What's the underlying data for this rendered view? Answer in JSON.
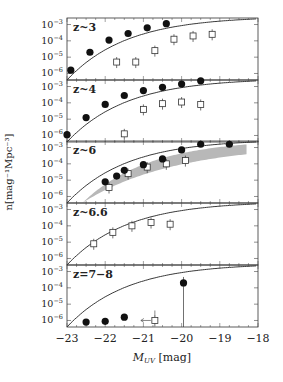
{
  "chart_data": {
    "type": "scatter",
    "xlabel": "M_UV [mag]",
    "ylabel": "n [mag^-1 Mpc^-3]",
    "xlim": [
      -23,
      -18
    ],
    "xticks": [
      -23,
      -22,
      -21,
      -20,
      -19,
      -18
    ],
    "ylim_log10": [
      -6.4,
      -2.6
    ],
    "yticks": [
      "10^-3",
      "10^-4",
      "10^-5",
      "10^-6"
    ],
    "panels": [
      {
        "label": "z~3",
        "filled": [
          [
            -22.9,
            -5.8
          ],
          [
            -22.4,
            -4.7
          ],
          [
            -21.9,
            -3.95
          ],
          [
            -21.4,
            -3.55
          ],
          [
            -20.9,
            -3.2
          ],
          [
            -20.4,
            -2.95
          ]
        ],
        "open": [
          [
            -21.7,
            -5.3
          ],
          [
            -21.2,
            -5.3
          ],
          [
            -20.7,
            -4.6
          ],
          [
            -20.2,
            -3.9
          ],
          [
            -19.7,
            -3.7
          ],
          [
            -19.2,
            -3.6
          ]
        ],
        "curve": true,
        "band": false
      },
      {
        "label": "z~4",
        "filled": [
          [
            -23.0,
            -5.95
          ],
          [
            -22.5,
            -4.9
          ],
          [
            -22.0,
            -4.1
          ],
          [
            -21.5,
            -3.55
          ],
          [
            -21.0,
            -3.25
          ],
          [
            -20.5,
            -3.05
          ],
          [
            -20.0,
            -2.85
          ],
          [
            -19.5,
            -2.65
          ]
        ],
        "open": [
          [
            -21.5,
            -5.9
          ],
          [
            -21.0,
            -4.4
          ],
          [
            -20.5,
            -4.05
          ],
          [
            -20.0,
            -3.95
          ],
          [
            -19.5,
            -4.1
          ]
        ],
        "curve": true,
        "band": false
      },
      {
        "label": "z~6",
        "filled": [
          [
            -22.0,
            -5.1
          ],
          [
            -21.7,
            -4.75
          ],
          [
            -21.5,
            -4.4
          ],
          [
            -21.0,
            -4.05
          ],
          [
            -20.5,
            -3.7
          ],
          [
            -20.0,
            -3.15
          ],
          [
            -19.5,
            -2.8
          ],
          [
            -18.75,
            -2.8
          ]
        ],
        "open": [
          [
            -21.9,
            -5.45
          ],
          [
            -21.4,
            -4.6
          ],
          [
            -20.9,
            -4.2
          ],
          [
            -20.4,
            -4.0
          ],
          [
            -19.9,
            -3.8
          ]
        ],
        "curve": true,
        "band": true
      },
      {
        "label": "z~6.6",
        "filled": [],
        "open": [
          [
            -22.3,
            -5.1
          ],
          [
            -21.8,
            -4.4
          ],
          [
            -21.3,
            -4.0
          ],
          [
            -20.8,
            -3.8
          ],
          [
            -20.3,
            -3.9
          ]
        ],
        "curve": true,
        "band": false
      },
      {
        "label": "z=7−8",
        "filled": [
          [
            -22.5,
            -6.1
          ],
          [
            -22.0,
            -6.05
          ],
          [
            -21.5,
            -5.8
          ],
          [
            -19.95,
            -3.7
          ]
        ],
        "open": [
          [
            -20.7,
            -6.0
          ]
        ],
        "curve": true,
        "band": false
      }
    ]
  },
  "labels": {
    "xlabel": "M",
    "xlabel_sub": "UV",
    "xlabel_unit": "[mag]",
    "ylabel": "n[mag⁻¹Mpc⁻³]"
  }
}
